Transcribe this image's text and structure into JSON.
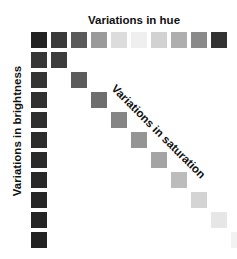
{
  "labels": {
    "hue": "Variations in hue",
    "brightness": "Variations in brightness",
    "saturation": "Variations in saturation"
  },
  "grid": {
    "origin_x": 31,
    "origin_y": 32,
    "step": 20,
    "size": 16
  },
  "hue_row": [
    "#222222",
    "#3a3a3a",
    "#5a5a5a",
    "#9a9a9a",
    "#dcdcdc",
    "#efefef",
    "#d2d2d2",
    "#aeaeae",
    "#8a8a8a",
    "#333333"
  ],
  "brightness_column": [
    "#363636",
    "#333333",
    "#303030",
    "#2e2e2e",
    "#2c2c2c",
    "#2a2a2a",
    "#282828",
    "#262626",
    "#242424",
    "#222222"
  ],
  "saturation_diagonal": [
    "#3c3c3c",
    "#5c5c5c",
    "#6e6e6e",
    "#858585",
    "#949494",
    "#a4a4a4",
    "#bcbcbc",
    "#d4d4d4",
    "#e6e6e6",
    "#f2f2f2"
  ]
}
